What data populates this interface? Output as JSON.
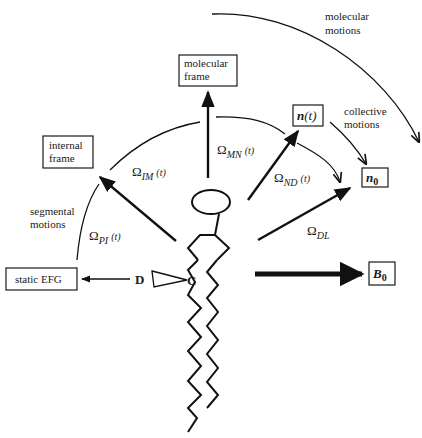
{
  "diagram": {
    "type": "molecular frame transformation diagram (lipid with deuterium label)",
    "boxes": {
      "molecular_frame": [
        "molecular",
        "frame"
      ],
      "internal_frame": [
        "internal",
        "frame"
      ],
      "static_efg": "static EFG",
      "director": "n(t)",
      "director_n": "n",
      "director_t": "(t)",
      "n0_base": "n",
      "n0_sub": "0",
      "b0_base": "B",
      "b0_sub": "0"
    },
    "annotations": {
      "molecular_motions": [
        "molecular",
        "motions"
      ],
      "collective_motions": [
        "collective",
        "motions"
      ],
      "segmental_motions": [
        "segmental",
        "motions"
      ]
    },
    "angles": {
      "omega_symbol": "Ω",
      "im": {
        "sub": "IM",
        "arg": "(t)"
      },
      "mn": {
        "sub": "MN",
        "arg": "(t)"
      },
      "nd": {
        "sub": "ND",
        "arg": "(t)"
      },
      "pi": {
        "sub": "PI",
        "arg": "(t)"
      },
      "dl": {
        "sub": "DL",
        "arg": ""
      }
    },
    "atoms": {
      "deuterium": "D",
      "carbon": "C"
    },
    "colors": {
      "ink": "#111111",
      "background": "#ffffff"
    }
  }
}
